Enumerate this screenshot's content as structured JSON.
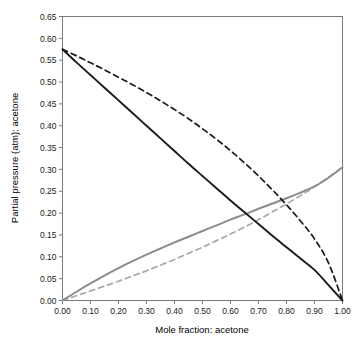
{
  "chart_data": {
    "type": "line",
    "title": "",
    "xlabel": "Mole fraction: acetone",
    "ylabel": "Partial pressure (atm): acetone",
    "xlim": [
      0.0,
      1.0
    ],
    "ylim": [
      0.0,
      0.65
    ],
    "xticks": [
      "0.00",
      "0.10",
      "0.20",
      "0.30",
      "0.40",
      "0.50",
      "0.60",
      "0.70",
      "0.80",
      "0.90",
      "1.00"
    ],
    "yticks": [
      "0.00",
      "0.05",
      "0.10",
      "0.15",
      "0.20",
      "0.25",
      "0.30",
      "0.35",
      "0.40",
      "0.45",
      "0.50",
      "0.55",
      "0.60",
      "0.65"
    ],
    "xtick_values": [
      0.0,
      0.1,
      0.2,
      0.3,
      0.4,
      0.5,
      0.6,
      0.7,
      0.8,
      0.9,
      1.0
    ],
    "ytick_values": [
      0.0,
      0.05,
      0.1,
      0.15,
      0.2,
      0.25,
      0.3,
      0.35,
      0.4,
      0.45,
      0.5,
      0.55,
      0.6,
      0.65
    ],
    "grid": false,
    "legend": "none",
    "x": [
      0.0,
      0.05,
      0.1,
      0.15,
      0.2,
      0.25,
      0.3,
      0.35,
      0.4,
      0.45,
      0.5,
      0.55,
      0.6,
      0.65,
      0.7,
      0.75,
      0.8,
      0.85,
      0.9,
      0.95,
      1.0
    ],
    "series": [
      {
        "name": "descending-actual",
        "style": "solid",
        "color": "#1a1a1a",
        "width": 1.9,
        "values": [
          0.575,
          0.545,
          0.516,
          0.487,
          0.458,
          0.429,
          0.4,
          0.371,
          0.342,
          0.313,
          0.285,
          0.257,
          0.229,
          0.202,
          0.175,
          0.148,
          0.122,
          0.096,
          0.07,
          0.035,
          0.0
        ]
      },
      {
        "name": "descending-ideal-raoult",
        "style": "dashed",
        "color": "#1a1a1a",
        "width": 1.7,
        "values": [
          0.575,
          0.56,
          0.544,
          0.528,
          0.511,
          0.494,
          0.476,
          0.457,
          0.437,
          0.416,
          0.393,
          0.369,
          0.343,
          0.315,
          0.285,
          0.253,
          0.219,
          0.182,
          0.141,
          0.086,
          0.0
        ]
      },
      {
        "name": "ascending-actual",
        "style": "solid",
        "color": "#8c8c8c",
        "width": 2.0,
        "values": [
          0.0,
          0.02,
          0.039,
          0.057,
          0.074,
          0.09,
          0.105,
          0.119,
          0.133,
          0.146,
          0.159,
          0.172,
          0.185,
          0.197,
          0.21,
          0.222,
          0.234,
          0.247,
          0.261,
          0.281,
          0.305
        ]
      },
      {
        "name": "ascending-ideal-raoult",
        "style": "dashed",
        "color": "#a8a8a8",
        "width": 1.7,
        "values": [
          0.0,
          0.011,
          0.022,
          0.033,
          0.044,
          0.056,
          0.068,
          0.081,
          0.094,
          0.108,
          0.122,
          0.137,
          0.152,
          0.168,
          0.185,
          0.203,
          0.221,
          0.24,
          0.26,
          0.282,
          0.305
        ]
      }
    ],
    "annotations": []
  },
  "colors": {
    "axis": "#7a7a7a",
    "plot_background": "#ffffff",
    "text": "#1a1a1a",
    "series_dark": "#1a1a1a",
    "series_gray": "#8c8c8c",
    "series_light_gray": "#a8a8a8"
  }
}
